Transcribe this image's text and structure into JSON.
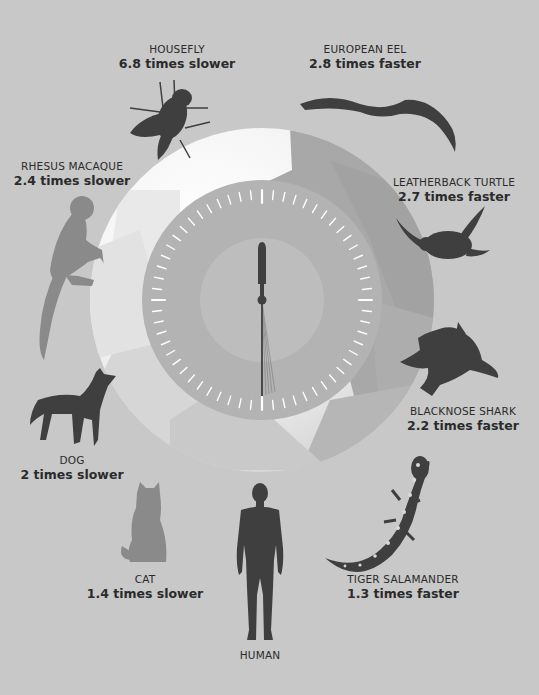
{
  "colors": {
    "background": "#c8c8c8",
    "circle_light": "#ffffff",
    "circle_dark": "#a6a6a6",
    "dial_ring": "#b2b2b2",
    "dial_center": "#bdbdbd",
    "silhouette": "#3f3f3f",
    "silhouette_light": "#8a8a8a",
    "text": "#2b2b2b",
    "tick": "#ffffff"
  },
  "clock": {
    "minute_hand": "12",
    "second_hand": "6"
  },
  "animals": [
    {
      "id": "housefly",
      "name": "HOUSEFLY",
      "rate": "6.8 times slower"
    },
    {
      "id": "european-eel",
      "name": "EUROPEAN EEL",
      "rate": "2.8 times faster"
    },
    {
      "id": "rhesus-macaque",
      "name": "RHESUS MACAQUE",
      "rate": "2.4 times slower"
    },
    {
      "id": "leatherback-turtle",
      "name": "LEATHERBACK TURTLE",
      "rate": "2.7 times faster"
    },
    {
      "id": "blacknose-shark",
      "name": "BLACKNOSE SHARK",
      "rate": "2.2 times faster"
    },
    {
      "id": "dog",
      "name": "DOG",
      "rate": "2 times slower"
    },
    {
      "id": "cat",
      "name": "CAT",
      "rate": "1.4 times slower"
    },
    {
      "id": "tiger-salamander",
      "name": "TIGER SALAMANDER",
      "rate": "1.3 times faster"
    },
    {
      "id": "human",
      "name": "HUMAN",
      "rate": ""
    }
  ]
}
